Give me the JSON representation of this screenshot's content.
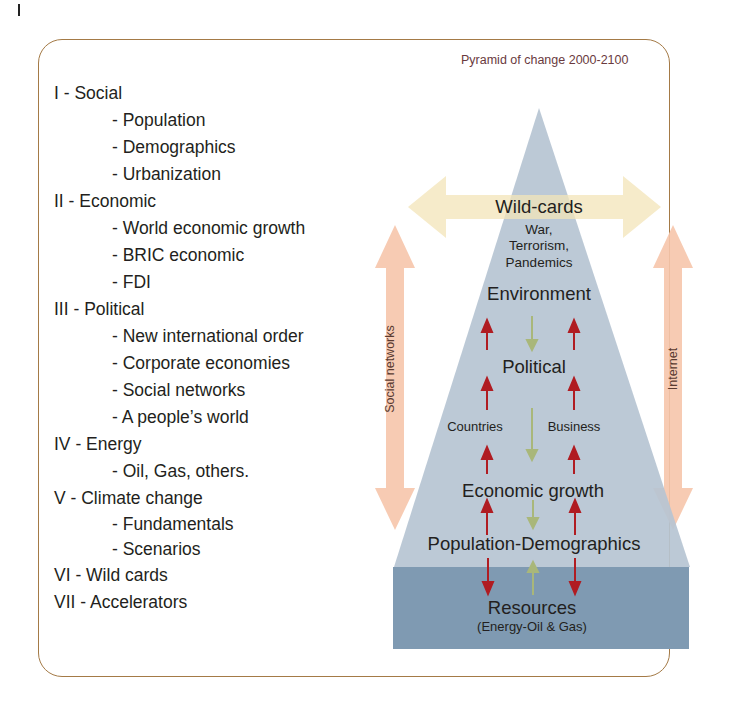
{
  "outline": {
    "sections": [
      {
        "label": "I - Social",
        "items": [
          "- Population",
          "- Demographics",
          "- Urbanization"
        ]
      },
      {
        "label": "II - Economic",
        "items": [
          "- World economic growth",
          "- BRIC economic",
          "- FDI"
        ]
      },
      {
        "label": "III - Political",
        "items": [
          "- New international order",
          "- Corporate economies",
          "- Social networks",
          "- A people’s world"
        ]
      },
      {
        "label": "IV - Energy",
        "items": [
          "- Oil, Gas, others."
        ]
      },
      {
        "label": "V - Climate change",
        "items": [
          "- Fundamentals",
          "- Scenarios"
        ]
      },
      {
        "label": "VI - Wild cards",
        "items": []
      },
      {
        "label": "VII - Accelerators",
        "items": []
      }
    ]
  },
  "diagram": {
    "title": "Pyramid of change 2000-2100",
    "wildcards": {
      "label": "Wild-cards",
      "line1": "War,",
      "line2": "Terrorism,",
      "line3": "Pandemics"
    },
    "levels": {
      "environment": "Environment",
      "political": "Political",
      "countries": "Countries",
      "business": "Business",
      "economic": "Economic growth",
      "population": "Population-Demographics",
      "resources": "Resources",
      "resources_sub": "(Energy-Oil & Gas)"
    },
    "left_arrow_label": "Social networks",
    "right_arrow_label": "Internet",
    "colors": {
      "pyramid": "#b6c4d3",
      "base": "#7f9ab2",
      "wildcard_arrow": "#f3e4b8",
      "side_arrow": "#f6c5ab",
      "red_arrow": "#b01c22",
      "green_arrow": "#a9b77a",
      "frame": "#a47a46"
    }
  }
}
